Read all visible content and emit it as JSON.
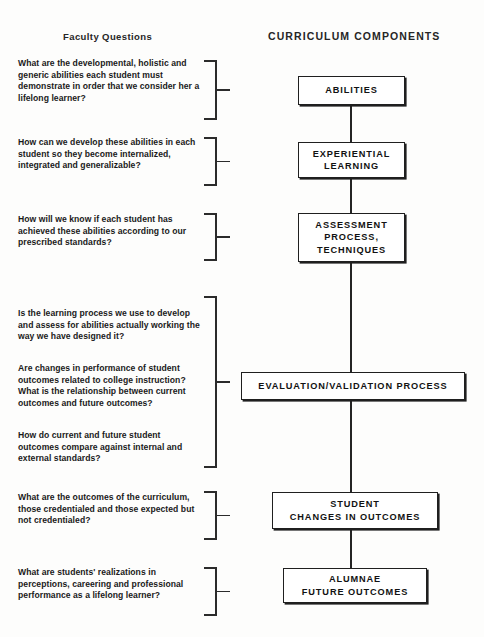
{
  "headings": {
    "left": "Faculty Questions",
    "right": "CURRICULUM COMPONENTS"
  },
  "questions": [
    {
      "id": "q-abilities",
      "text": "What are the developmental, holistic and generic abilities each student must demonstrate in order that we consider her a lifelong learner?"
    },
    {
      "id": "q-experiential",
      "text": "How can we develop these abilities in each student so they become internalized, integrated and generalizable?"
    },
    {
      "id": "q-assessment",
      "text": "How will we know if each student has achieved these abilities according to our prescribed standards?"
    },
    {
      "id": "q-evaluation-1",
      "text": "Is the learning process we use to develop and assess for abilities actually working the way we have designed it?"
    },
    {
      "id": "q-evaluation-2",
      "text": "Are changes in performance of student outcomes related to college instruction?  What is the relationship between current outcomes and future outcomes?"
    },
    {
      "id": "q-evaluation-3",
      "text": "How do current and future student outcomes compare against internal and external standards?"
    },
    {
      "id": "q-student-changes",
      "text": "What are the outcomes of the curriculum, those credentialed and those expected but not credentialed?"
    },
    {
      "id": "q-alumnae",
      "text": "What are students' realizations in perceptions, careering and professional performance as a lifelong learner?"
    }
  ],
  "components": [
    {
      "id": "abilities",
      "label": "ABILITIES"
    },
    {
      "id": "experiential",
      "label": "EXPERIENTIAL\nLEARNING"
    },
    {
      "id": "assessment",
      "label": "ASSESSMENT\nPROCESS,\nTECHNIQUES"
    },
    {
      "id": "evaluation",
      "label": "EVALUATION/VALIDATION  PROCESS"
    },
    {
      "id": "student-changes",
      "label": "STUDENT\nCHANGES IN OUTCOMES"
    },
    {
      "id": "alumnae",
      "label": "ALUMNAE\nFUTURE OUTCOMES"
    }
  ],
  "colors": {
    "ink": "#1f1f1f",
    "paper": "#fdfdfc"
  }
}
